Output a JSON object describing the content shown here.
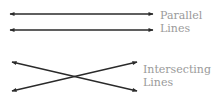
{
  "diagram": {
    "colors": {
      "line": "#2a2a2a",
      "label": "#9a9a9a",
      "background": "#ffffff"
    },
    "groups": [
      {
        "id": "parallel",
        "label_line1": "Parallel",
        "label_line2": "Lines",
        "lines": [
          {
            "x1": 10,
            "y1": 14,
            "x2": 153,
            "y2": 14,
            "arrows": "both"
          },
          {
            "x1": 10,
            "y1": 30,
            "x2": 153,
            "y2": 30,
            "arrows": "both"
          }
        ]
      },
      {
        "id": "intersecting",
        "label_line1": "Intersecting",
        "label_line2": "Lines",
        "lines": [
          {
            "x1": 12,
            "y1": 62,
            "x2": 137,
            "y2": 91,
            "arrows": "both"
          },
          {
            "x1": 12,
            "y1": 91,
            "x2": 137,
            "y2": 62,
            "arrows": "both"
          }
        ]
      }
    ]
  }
}
